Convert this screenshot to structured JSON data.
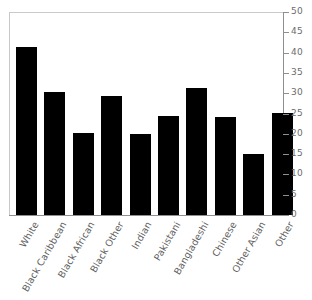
{
  "chart_data": {
    "type": "bar",
    "title": "",
    "xlabel": "",
    "ylabel": "",
    "categories": [
      "White",
      "Black Caribbean",
      "Black African",
      "Black Other",
      "Indian",
      "Pakistani",
      "Bangladeshi",
      "Chinese",
      "Other Asian",
      "Other"
    ],
    "values": [
      41.5,
      30.2,
      20.2,
      29.2,
      20.0,
      24.3,
      31.2,
      24.1,
      15.1,
      25.1
    ],
    "ylim": [
      0,
      50
    ],
    "ytick_values": [
      0,
      5,
      10,
      15,
      20,
      25,
      30,
      35,
      40,
      45,
      50
    ],
    "ytick_labels": [
      "0",
      "5",
      "10",
      "15",
      "20",
      "25",
      "30",
      "35",
      "40",
      "45",
      "50"
    ],
    "yaxis_position": "right",
    "grid": false,
    "legend": null,
    "bar_color": "#000000",
    "axis_color": "#8f8f8f",
    "tick_label_color": "#6b6b6b",
    "category_label_color": "#5f5f5f",
    "category_label_rotation": -60,
    "background_color": "#ffffff"
  }
}
